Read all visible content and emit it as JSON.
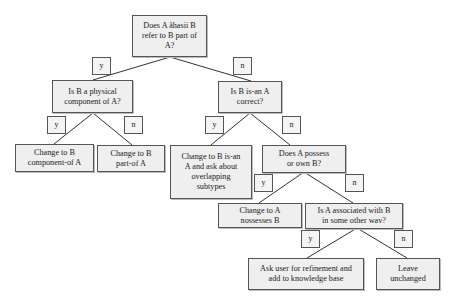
{
  "diagram": {
    "type": "decision-tree",
    "colors": {
      "background": "#ffffff",
      "node_fill": "#efefef",
      "node_border": "#555555",
      "edge": "#333333"
    },
    "nodes": {
      "root": "Does A ãhasii B\nrefer to B part of\nA?",
      "physical": "Is B a physical\ncomponent of A?",
      "isan": "Is B is-an A\ncorrect?",
      "component_of": "Change to B\ncomponent-of A",
      "part_of": "Change to B\npart-of A",
      "isan_overlap": "Change to B is-an\nA and ask about\noverlapping\nsubtypes",
      "possess": "Does A possess\nor own B?",
      "possesses": "Change to A\nnossesses B",
      "associated": "Is A associated with B\nin some other wav?",
      "ask_user": "Ask user for refinement and\nadd to knowledge base",
      "leave": "Leave\nunchanged"
    },
    "edge_labels": {
      "root_y": "y",
      "root_n": "n",
      "physical_y": "y",
      "physical_n": "n",
      "isan_y": "y",
      "isan_n": "n",
      "possess_y": "y",
      "possess_n": "n",
      "associated_y": "y",
      "associated_n": "n"
    }
  }
}
